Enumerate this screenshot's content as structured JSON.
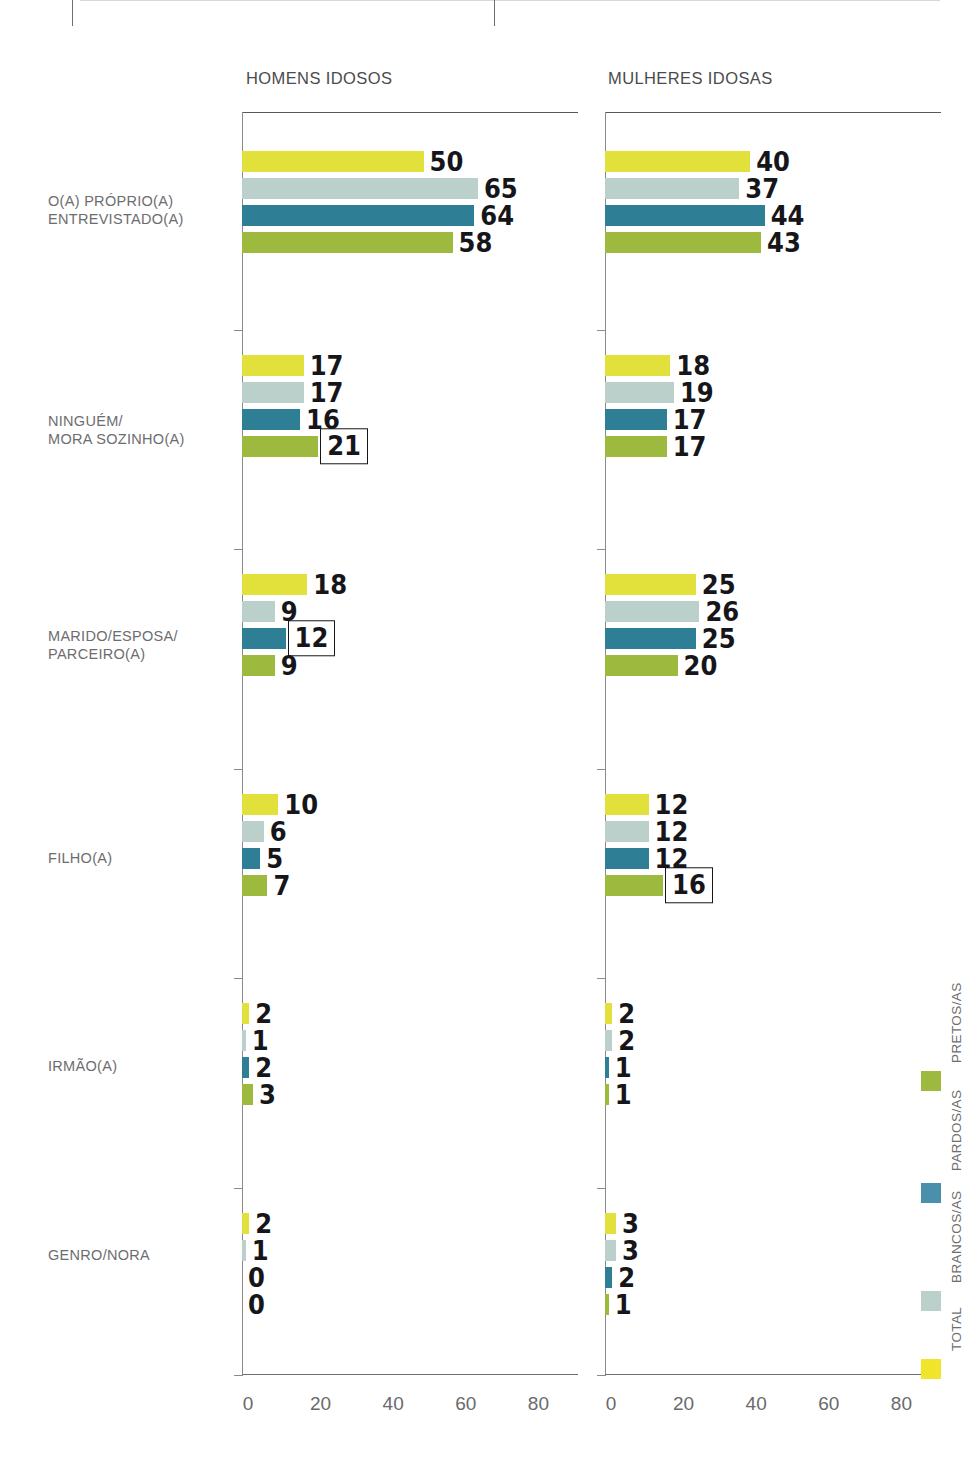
{
  "chart_data": {
    "type": "bar",
    "orientation": "horizontal",
    "title": "",
    "panels": [
      {
        "id": "homens",
        "title": "HOMENS IDOSOS",
        "categories": [
          "O(A) PRÓPRIO(A)\nENTREVISTADO(A)",
          "NINGUÉM/\nMORA SOZINHO(A)",
          "MARIDO/ESPOSA/\nPARCEIRO(A)",
          "FILHO(A)",
          "IRMÃO(A)",
          "GENRO/NORA"
        ],
        "series": [
          {
            "name": "TOTAL",
            "color": "#e2e03a",
            "values": [
              50,
              17,
              18,
              10,
              2,
              2
            ]
          },
          {
            "name": "BRANCOS/AS",
            "color": "#bbd0ca",
            "values": [
              65,
              17,
              9,
              6,
              1,
              1
            ]
          },
          {
            "name": "PARDOS/AS",
            "color": "#2e7e95",
            "values": [
              64,
              16,
              12,
              5,
              2,
              0
            ]
          },
          {
            "name": "PRETOS/AS",
            "color": "#9dba3f",
            "values": [
              58,
              21,
              9,
              7,
              3,
              0
            ]
          }
        ],
        "highlighted": [
          {
            "group": 1,
            "series": 3,
            "value": 21
          },
          {
            "group": 2,
            "series": 2,
            "value": 12
          }
        ],
        "xticks": [
          0,
          20,
          40,
          60,
          80
        ],
        "xlim": [
          0,
          92
        ],
        "xlabel": "",
        "ylabel": ""
      },
      {
        "id": "mulheres",
        "title": "MULHERES IDOSAS",
        "categories": [
          "O(A) PRÓPRIO(A)\nENTREVISTADO(A)",
          "NINGUÉM/\nMORA SOZINHO(A)",
          "MARIDO/ESPOSA/\nPARCEIRO(A)",
          "FILHO(A)",
          "IRMÃO(A)",
          "GENRO/NORA"
        ],
        "series": [
          {
            "name": "TOTAL",
            "color": "#e2e03a",
            "values": [
              40,
              18,
              25,
              12,
              2,
              3
            ]
          },
          {
            "name": "BRANCOS/AS",
            "color": "#bbd0ca",
            "values": [
              37,
              19,
              26,
              12,
              2,
              3
            ]
          },
          {
            "name": "PARDOS/AS",
            "color": "#2e7e95",
            "values": [
              44,
              17,
              25,
              12,
              1,
              2
            ]
          },
          {
            "name": "PRETOS/AS",
            "color": "#9dba3f",
            "values": [
              43,
              17,
              20,
              16,
              1,
              1
            ]
          }
        ],
        "highlighted": [
          {
            "group": 3,
            "series": 3,
            "value": 16
          }
        ],
        "xticks": [
          0,
          20,
          40,
          60,
          80
        ],
        "xlim": [
          0,
          92
        ],
        "xlabel": "",
        "ylabel": ""
      }
    ],
    "legend": {
      "position": "right-vertical",
      "entries": [
        {
          "label": "PRETOS/AS",
          "color": "#9dba3f"
        },
        {
          "label": "PARDOS/AS",
          "color": "#4a8fab"
        },
        {
          "label": "BRANCOS/AS",
          "color": "#bbd0ca"
        },
        {
          "label": "TOTAL",
          "color": "#f0e52a"
        }
      ]
    },
    "grid": false
  },
  "colors": {
    "total": "#e2e03a",
    "brancos": "#bbd0ca",
    "pardos": "#2e7e95",
    "pretos": "#9dba3f",
    "axis": "#6f6f71",
    "label_text": "#6d6d6f",
    "value_text": "#16161a"
  }
}
